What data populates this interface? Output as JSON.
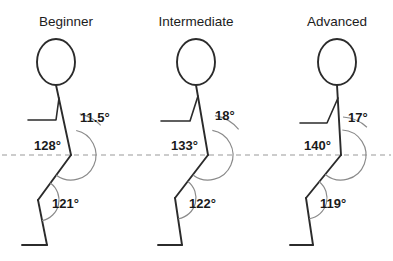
{
  "diagram": {
    "title_row_baseline": 26,
    "reference_line": {
      "name": "horizontal-reference-line",
      "y": 155,
      "x1": 2,
      "x2": 391,
      "style": "dashed"
    },
    "colors": {
      "background": "#ffffff",
      "stroke": "#2b2b2b",
      "arc": "#8a8a8a",
      "reference": "#9a9a9a",
      "text": "#1a1a1a"
    },
    "panels": [
      {
        "id": "beginner",
        "title": "Beginner",
        "title_x": 66,
        "head": {
          "cx": 56,
          "cy": 62,
          "rx": 19,
          "ry": 23
        },
        "torso": {
          "x1": 56,
          "y1": 85,
          "x2": 71,
          "y2": 155
        },
        "arm": {
          "shoulder_x": 59,
          "shoulder_y": 98,
          "elbow_x": 56,
          "elbow_y": 120,
          "hand_x": 28,
          "hand_y": 120
        },
        "thigh": {
          "x1": 71,
          "y1": 155,
          "x2": 38,
          "y2": 200
        },
        "shank": {
          "x1": 38,
          "y1": 200,
          "x2": 47,
          "y2": 245
        },
        "foot": {
          "x1": 47,
          "y1": 245,
          "x2": 22,
          "y2": 245
        },
        "angles": [
          {
            "name": "trunk-angle",
            "value": "11.5°",
            "x": 80,
            "y": 122,
            "anchor": "start",
            "arc": {
              "cx": 71,
              "cy": 155,
              "r": 42,
              "start_deg": -78,
              "end_deg": -45
            }
          },
          {
            "name": "hip-angle",
            "value": "128°",
            "x": 61,
            "y": 150,
            "anchor": "end",
            "arc": {
              "cx": 71,
              "cy": 155,
              "r": 25,
              "start_deg": -78,
              "end_deg": 126
            }
          },
          {
            "name": "knee-angle",
            "value": "121°",
            "x": 52,
            "y": 208,
            "anchor": "start",
            "arc": {
              "cx": 38,
              "cy": 200,
              "r": 21,
              "start_deg": -54,
              "end_deg": 79
            }
          }
        ]
      },
      {
        "id": "intermediate",
        "title": "Intermediate",
        "title_x": 196,
        "head": {
          "cx": 196,
          "cy": 62,
          "rx": 19,
          "ry": 23
        },
        "torso": {
          "x1": 196,
          "y1": 85,
          "x2": 208,
          "y2": 155
        },
        "arm": {
          "shoulder_x": 198,
          "shoulder_y": 96,
          "elbow_x": 190,
          "elbow_y": 121,
          "hand_x": 161,
          "hand_y": 121
        },
        "thigh": {
          "x1": 208,
          "y1": 155,
          "x2": 175,
          "y2": 198
        },
        "shank": {
          "x1": 175,
          "y1": 198,
          "x2": 182,
          "y2": 245
        },
        "foot": {
          "x1": 182,
          "y1": 245,
          "x2": 158,
          "y2": 245
        },
        "angles": [
          {
            "name": "trunk-angle",
            "value": "18°",
            "x": 215,
            "y": 120,
            "anchor": "start",
            "arc": {
              "cx": 208,
              "cy": 155,
              "r": 40,
              "start_deg": -80,
              "end_deg": -40
            }
          },
          {
            "name": "hip-angle",
            "value": "133°",
            "x": 198,
            "y": 150,
            "anchor": "end",
            "arc": {
              "cx": 208,
              "cy": 155,
              "r": 25,
              "start_deg": -80,
              "end_deg": 127
            }
          },
          {
            "name": "knee-angle",
            "value": "122°",
            "x": 189,
            "y": 208,
            "anchor": "start",
            "arc": {
              "cx": 175,
              "cy": 198,
              "r": 21,
              "start_deg": -52,
              "end_deg": 81
            }
          }
        ]
      },
      {
        "id": "advanced",
        "title": "Advanced",
        "title_x": 337,
        "head": {
          "cx": 337,
          "cy": 62,
          "rx": 19,
          "ry": 23
        },
        "torso": {
          "x1": 337,
          "y1": 85,
          "x2": 341,
          "y2": 155
        },
        "arm": {
          "shoulder_x": 338,
          "shoulder_y": 98,
          "elbow_x": 327,
          "elbow_y": 123,
          "hand_x": 300,
          "hand_y": 123
        },
        "thigh": {
          "x1": 341,
          "y1": 155,
          "x2": 306,
          "y2": 198
        },
        "shank": {
          "x1": 306,
          "y1": 198,
          "x2": 313,
          "y2": 245
        },
        "foot": {
          "x1": 313,
          "y1": 245,
          "x2": 290,
          "y2": 245
        },
        "angles": [
          {
            "name": "trunk-angle",
            "value": "17°",
            "x": 348,
            "y": 122,
            "anchor": "start",
            "arc": {
              "cx": 341,
              "cy": 155,
              "r": 38,
              "start_deg": -87,
              "end_deg": -47
            }
          },
          {
            "name": "hip-angle",
            "value": "140°",
            "x": 331,
            "y": 150,
            "anchor": "end",
            "arc": {
              "cx": 341,
              "cy": 155,
              "r": 25,
              "start_deg": -87,
              "end_deg": 129
            }
          },
          {
            "name": "knee-angle",
            "value": "119°",
            "x": 320,
            "y": 208,
            "anchor": "start",
            "arc": {
              "cx": 306,
              "cy": 198,
              "r": 21,
              "start_deg": -51,
              "end_deg": 81
            }
          }
        ]
      }
    ]
  },
  "chart_data": {
    "type": "diagram",
    "title": "",
    "categories": [
      "Beginner",
      "Intermediate",
      "Advanced"
    ],
    "series": [
      {
        "name": "Trunk angle",
        "values": [
          11.5,
          18,
          17
        ],
        "unit": "degrees"
      },
      {
        "name": "Hip angle",
        "values": [
          128,
          133,
          140
        ],
        "unit": "degrees"
      },
      {
        "name": "Knee angle",
        "values": [
          121,
          122,
          119
        ],
        "unit": "degrees"
      }
    ],
    "annotations": [
      "11.5°",
      "128°",
      "121°",
      "18°",
      "133°",
      "122°",
      "17°",
      "140°",
      "119°"
    ],
    "legend": "none",
    "grid": false
  }
}
